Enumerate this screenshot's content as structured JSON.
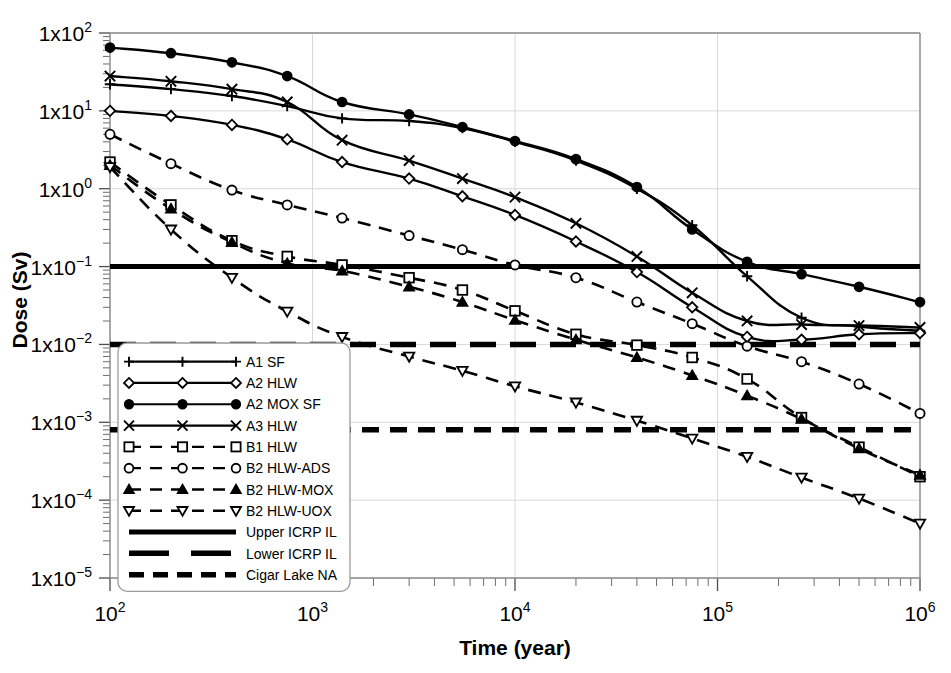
{
  "chart_data": {
    "type": "line",
    "title": "",
    "xlabel": "Time (year)",
    "ylabel": "Dose (Sv)",
    "xscale": "log",
    "yscale": "log",
    "xlim": [
      100,
      1000000
    ],
    "ylim": [
      1e-05,
      100
    ],
    "grid": true,
    "legend_position": "lower-left-inside",
    "x_tick_labels": [
      "10²",
      "10³",
      "10⁴",
      "10⁵",
      "10⁶"
    ],
    "x_tick_values": [
      100,
      1000,
      10000,
      100000,
      1000000
    ],
    "y_tick_labels": [
      "1x10²",
      "1x10¹",
      "1x10⁰",
      "1x10⁻¹",
      "1x10⁻²",
      "1x10⁻³",
      "1x10⁻⁴",
      "1x10⁻⁵"
    ],
    "y_tick_values": [
      100,
      10,
      1,
      0.1,
      0.01,
      0.001,
      0.0001,
      1e-05
    ],
    "series": [
      {
        "name": "A1 SF",
        "style": "solid",
        "marker": "plus",
        "x": [
          100,
          200,
          400,
          750,
          1400,
          3000,
          5500,
          10000,
          20000,
          40000,
          75000,
          140000,
          260000,
          500000,
          1000000
        ],
        "y": [
          22,
          19,
          15.5,
          11.5,
          8.0,
          7.4,
          6.0,
          4.0,
          2.3,
          1.0,
          0.34,
          0.075,
          0.022,
          0.017,
          0.015
        ]
      },
      {
        "name": "A2 HLW",
        "style": "solid",
        "marker": "diamond",
        "x": [
          100,
          200,
          400,
          750,
          1400,
          3000,
          5500,
          10000,
          20000,
          40000,
          75000,
          140000,
          260000,
          500000,
          1000000
        ],
        "y": [
          10,
          8.6,
          6.6,
          4.3,
          2.2,
          1.35,
          0.8,
          0.46,
          0.21,
          0.085,
          0.03,
          0.0125,
          0.0115,
          0.0135,
          0.014
        ]
      },
      {
        "name": "A2 MOX SF",
        "style": "solid",
        "marker": "circle-filled",
        "x": [
          100,
          200,
          400,
          750,
          1400,
          3000,
          5500,
          10000,
          20000,
          40000,
          75000,
          140000,
          260000,
          500000,
          1000000
        ],
        "y": [
          65,
          55,
          42,
          28,
          13,
          9.0,
          6.2,
          4.1,
          2.4,
          1.05,
          0.3,
          0.115,
          0.08,
          0.055,
          0.035
        ]
      },
      {
        "name": "A3 HLW",
        "style": "solid",
        "marker": "x",
        "x": [
          100,
          200,
          400,
          750,
          1400,
          3000,
          5500,
          10000,
          20000,
          40000,
          75000,
          140000,
          260000,
          500000,
          1000000
        ],
        "y": [
          28,
          24,
          19,
          13,
          4.2,
          2.3,
          1.35,
          0.78,
          0.36,
          0.135,
          0.046,
          0.02,
          0.018,
          0.0175,
          0.0165
        ]
      },
      {
        "name": "B1 HLW",
        "style": "dashed",
        "marker": "square",
        "x": [
          100,
          200,
          400,
          750,
          1400,
          3000,
          5500,
          10000,
          20000,
          40000,
          75000,
          140000,
          260000,
          500000,
          1000000
        ],
        "y": [
          2.2,
          0.62,
          0.215,
          0.135,
          0.105,
          0.072,
          0.05,
          0.027,
          0.0135,
          0.0098,
          0.0068,
          0.0036,
          0.00115,
          0.00048,
          0.0002
        ]
      },
      {
        "name": "B2 HLW-ADS",
        "style": "dashed",
        "marker": "circle",
        "x": [
          100,
          200,
          400,
          750,
          1400,
          3000,
          5500,
          10000,
          20000,
          40000,
          75000,
          140000,
          260000,
          500000,
          1000000
        ],
        "y": [
          5.0,
          2.1,
          0.96,
          0.62,
          0.42,
          0.25,
          0.165,
          0.105,
          0.072,
          0.035,
          0.0185,
          0.0095,
          0.006,
          0.0031,
          0.0013
        ]
      },
      {
        "name": "B2 HLW-MOX",
        "style": "dashed",
        "marker": "triangle-up-filled",
        "x": [
          100,
          200,
          400,
          750,
          1400,
          3000,
          5500,
          10000,
          20000,
          40000,
          75000,
          140000,
          260000,
          500000,
          1000000
        ],
        "y": [
          2.0,
          0.55,
          0.205,
          0.11,
          0.088,
          0.055,
          0.035,
          0.0205,
          0.0115,
          0.0068,
          0.004,
          0.0022,
          0.0011,
          0.00046,
          0.00021
        ]
      },
      {
        "name": "B2 HLW-UOX",
        "style": "dashed",
        "marker": "triangle-down",
        "x": [
          100,
          200,
          400,
          750,
          1400,
          3000,
          5500,
          10000,
          20000,
          40000,
          75000,
          140000,
          260000,
          500000,
          1000000
        ],
        "y": [
          1.9,
          0.3,
          0.072,
          0.0265,
          0.0125,
          0.007,
          0.0046,
          0.0029,
          0.0018,
          0.00105,
          0.00062,
          0.00036,
          0.000195,
          0.000105,
          5e-05
        ]
      }
    ],
    "reference_lines": [
      {
        "name": "Upper ICRP IL",
        "style": "solid",
        "value": 0.1
      },
      {
        "name": "Lower ICRP IL",
        "style": "longdash",
        "value": 0.01
      },
      {
        "name": "Cigar Lake NA",
        "style": "dashed",
        "value": 0.0008
      }
    ]
  },
  "legend": {
    "items": [
      {
        "label": "A1 SF",
        "marker": "plus",
        "style": "solid"
      },
      {
        "label": "A2 HLW",
        "marker": "diamond",
        "style": "solid"
      },
      {
        "label": "A2 MOX SF",
        "marker": "circle-filled",
        "style": "solid"
      },
      {
        "label": "A3 HLW",
        "marker": "x",
        "style": "solid"
      },
      {
        "label": "B1 HLW",
        "marker": "square",
        "style": "dashed"
      },
      {
        "label": "B2 HLW-ADS",
        "marker": "circle",
        "style": "dashed"
      },
      {
        "label": "B2 HLW-MOX",
        "marker": "triangle-up-filled",
        "style": "dashed"
      },
      {
        "label": "B2 HLW-UOX",
        "marker": "triangle-down",
        "style": "dashed"
      },
      {
        "label": "Upper ICRP IL",
        "marker": "none",
        "style": "ref-solid"
      },
      {
        "label": "Lower ICRP IL",
        "marker": "none",
        "style": "ref-longdash"
      },
      {
        "label": "Cigar Lake NA",
        "marker": "none",
        "style": "ref-dash"
      }
    ]
  },
  "colors": {
    "line": "#000000",
    "grid": "#d9d9d9",
    "frame": "#8c8c8c",
    "background": "#ffffff"
  }
}
